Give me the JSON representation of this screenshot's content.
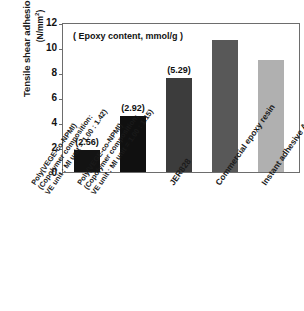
{
  "chart_data": {
    "type": "bar",
    "title": "",
    "subtitle": "",
    "annotation": "( Epoxy content, mmol/g )",
    "xlabel": "",
    "ylabel": "Tensile shear adhesion strength",
    "ylabel_units": "(N/mm",
    "ylabel_units_sup": "2",
    "ylabel_units_close": ")",
    "ylim": [
      0,
      12
    ],
    "yticks": [
      "12",
      "10",
      "8",
      "6",
      "4",
      "2",
      "0"
    ],
    "ytick_values": [
      12,
      10,
      8,
      6,
      4,
      2,
      0
    ],
    "grid": false,
    "legend": "none",
    "categories": [
      "Poly(VEGE-co-NPMI) (Copolymer composition: VE unit : MI unit = 1.00 : 1.42)",
      "Poly(VEGE-co-NPMI) (Copolymer composition: VE unit : MI unit = 1.00 : 1.15)",
      "JER828",
      "Commercial epoxy resin",
      "Instant adhesive Aron Alpha®"
    ],
    "category_lines": [
      [
        "Poly(VEGE-co-NPMI)",
        "(Copolymer composition:",
        "VE unit : MI unit = 1.00 : 1.42)"
      ],
      [
        "Poly(VEGE-co-NPMI)",
        "(Copolymer composition:",
        "VE unit : MI unit = 1.00 : 1.15)"
      ],
      [
        "JER828"
      ],
      [
        "Commercial epoxy resin"
      ],
      [
        "Instant adhesive Aron Alpha®"
      ]
    ],
    "values": [
      1.75,
      4.5,
      7.6,
      10.65,
      9.0
    ],
    "point_labels": [
      "(2.56)",
      "(2.92)",
      "(5.29)",
      "",
      ""
    ],
    "epoxy_content": [
      2.56,
      2.92,
      5.29,
      null,
      null
    ],
    "bar_colors": [
      "#131313",
      "#101010",
      "#3c3c3c",
      "#585858",
      "#b0b0b0"
    ],
    "axis_color": "#6d6d6d"
  }
}
